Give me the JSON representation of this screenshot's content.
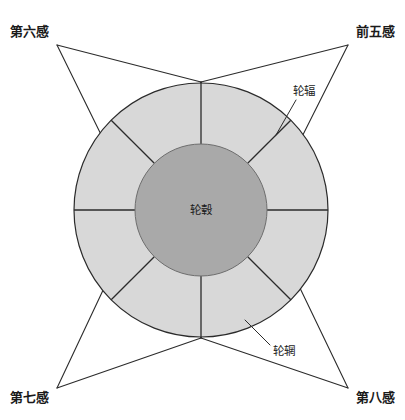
{
  "figure": {
    "type": "wheel-diagram",
    "background_color": "#ffffff",
    "line_color": "#2b2b2b"
  },
  "wheel": {
    "center": {
      "x": 201,
      "y": 210
    },
    "outer_radius": 127,
    "inner_radius": 66,
    "rim_color": "#d8d8d8",
    "hub_color": "#a9a9a9",
    "spoke_count": 8,
    "hub": {
      "label": "轮毂"
    },
    "rim": {
      "label": "轮辋"
    },
    "spokes": {
      "label": "轮辐"
    }
  },
  "corner_labels": [
    {
      "key": "top_left",
      "text": "第六感",
      "x": 10,
      "y": 36
    },
    {
      "key": "top_right",
      "text": "前五感",
      "x": 345,
      "y": 36
    },
    {
      "key": "bottom_left",
      "text": "第七感",
      "x": 10,
      "y": 400
    },
    {
      "key": "bottom_right",
      "text": "第八感",
      "x": 345,
      "y": 400
    }
  ],
  "callouts": [
    {
      "key": "spoke",
      "text": "轮辐",
      "x": 293,
      "y": 95
    },
    {
      "key": "rim",
      "text": "轮辋",
      "x": 273,
      "y": 351
    }
  ]
}
